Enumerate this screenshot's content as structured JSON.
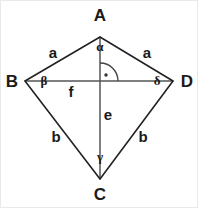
{
  "figure": {
    "background_color": "#ffffff",
    "border_color": "#e9e9e9",
    "stroke_color": "#222222",
    "diagonal_color": "#555555",
    "text_color": "#1a1a1a"
  },
  "vertices": {
    "a": {
      "label": "A",
      "x": 99,
      "y": 36,
      "label_x": 99,
      "label_y": 20
    },
    "b": {
      "label": "B",
      "x": 24,
      "y": 80,
      "label_x": 11,
      "label_y": 86
    },
    "c": {
      "label": "C",
      "x": 99,
      "y": 178,
      "label_x": 99,
      "label_y": 199
    },
    "d": {
      "label": "D",
      "x": 172,
      "y": 80,
      "label_x": 186,
      "label_y": 86
    }
  },
  "sides": {
    "ab": {
      "label": "a",
      "label_x": 52,
      "label_y": 57
    },
    "ad": {
      "label": "a",
      "label_x": 146,
      "label_y": 57
    },
    "bc": {
      "label": "b",
      "label_x": 55,
      "label_y": 141
    },
    "dc": {
      "label": "b",
      "label_x": 142,
      "label_y": 141
    }
  },
  "diagonals": {
    "vertical": {
      "label": "e",
      "from": "A",
      "to": "C",
      "label_x": 107,
      "label_y": 119
    },
    "horizontal": {
      "label": "f",
      "from": "B",
      "to": "D",
      "label_x": 70,
      "label_y": 96
    }
  },
  "angles": {
    "alpha": {
      "label": "α",
      "at_vertex": "A",
      "label_x": 99,
      "label_y": 50
    },
    "beta": {
      "label": "β",
      "at_vertex": "B",
      "label_x": 43,
      "label_y": 84
    },
    "gamma": {
      "label": "γ",
      "at_vertex": "C",
      "label_x": 99,
      "label_y": 160
    },
    "delta": {
      "label": "δ",
      "at_vertex": "D",
      "label_x": 156,
      "label_y": 84
    }
  },
  "right_angle_marker": {
    "name": "right-angle-at-diagonal-intersection",
    "center_x": 99,
    "center_y": 80,
    "radius": 18,
    "dot_x": 105,
    "dot_y": 74,
    "quadrant": "upper-right"
  }
}
